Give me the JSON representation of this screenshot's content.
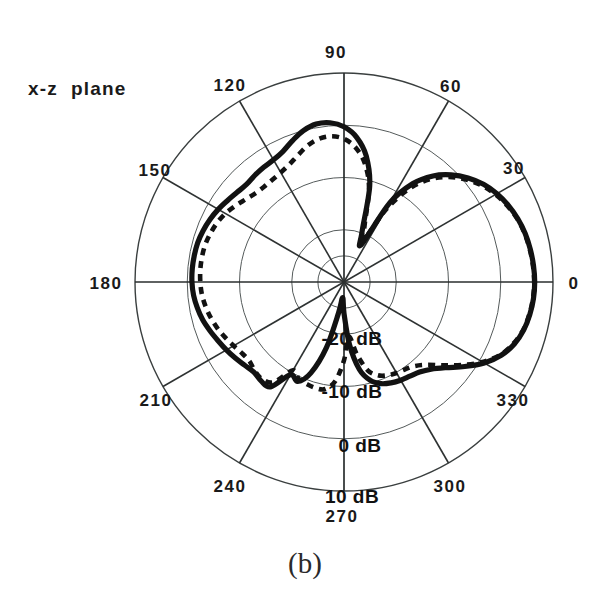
{
  "figure": {
    "plane_label": "x-z  plane",
    "caption": "(b)"
  },
  "chart_data": {
    "type": "line",
    "plot_style": "polar",
    "title": "x-z plane",
    "subtitle": "(b)",
    "xlabel": "",
    "ylabel": "",
    "grid": true,
    "legend_position": "none",
    "angular_axis": {
      "label": "angle (degrees)",
      "unit": "deg",
      "direction": "counterclockwise",
      "zero_at": "east",
      "tick_step": 30,
      "tick_labels": [
        "0",
        "30",
        "60",
        "90",
        "120",
        "150",
        "180",
        "210",
        "240",
        "270",
        "300",
        "330"
      ]
    },
    "radial_axis": {
      "label": "dB",
      "unit": "dB",
      "rlim": [
        -30,
        10
      ],
      "ring_values": [
        -20,
        -10,
        0,
        10
      ],
      "ring_labels": [
        "-20 dB",
        "-10 dB",
        "0 dB",
        "10 dB"
      ],
      "center_value": -30,
      "outer_value": 10
    },
    "series": [
      {
        "name": "measured",
        "style": "solid",
        "x": [
          0,
          5,
          10,
          15,
          20,
          25,
          30,
          35,
          40,
          45,
          50,
          55,
          60,
          65,
          70,
          75,
          80,
          85,
          90,
          95,
          100,
          105,
          110,
          115,
          120,
          125,
          130,
          135,
          140,
          145,
          150,
          155,
          160,
          165,
          170,
          175,
          180,
          185,
          190,
          195,
          200,
          205,
          210,
          215,
          220,
          225,
          230,
          235,
          240,
          245,
          250,
          255,
          260,
          265,
          270,
          275,
          280,
          285,
          290,
          295,
          300,
          305,
          310,
          315,
          320,
          325,
          330,
          335,
          340,
          345,
          350,
          355,
          360
        ],
        "values": [
          6.5,
          6.4,
          6.2,
          5.9,
          5.4,
          4.7,
          3.8,
          2.6,
          1.0,
          -1.0,
          -3.5,
          -7.0,
          -12.5,
          -22.0,
          -20.0,
          -11.0,
          -5.5,
          -2.2,
          -0.3,
          0.6,
          0.7,
          0.0,
          -1.2,
          -2.4,
          -3.0,
          -3.2,
          -3.4,
          -3.6,
          -3.3,
          -2.8,
          -2.2,
          -1.7,
          -1.3,
          -1.0,
          -0.9,
          -0.85,
          -0.9,
          -1.1,
          -1.5,
          -2.0,
          -2.7,
          -3.4,
          -4.0,
          -4.6,
          -5.2,
          -5.6,
          -5.3,
          -5.5,
          -9.5,
          -9.0,
          -11.5,
          -17.0,
          -24.0,
          -27.0,
          -24.0,
          -18.0,
          -13.0,
          -10.5,
          -9.3,
          -8.7,
          -8.3,
          -8.0,
          -7.5,
          -6.4,
          -4.5,
          -1.8,
          1.0,
          3.2,
          4.7,
          5.6,
          6.1,
          6.4,
          6.5
        ]
      },
      {
        "name": "computed",
        "style": "dashed",
        "x": [
          0,
          5,
          10,
          15,
          20,
          25,
          30,
          35,
          40,
          45,
          50,
          55,
          60,
          65,
          70,
          75,
          80,
          85,
          90,
          95,
          100,
          105,
          110,
          115,
          120,
          125,
          130,
          135,
          140,
          145,
          150,
          155,
          160,
          165,
          170,
          175,
          180,
          185,
          190,
          195,
          200,
          205,
          210,
          215,
          220,
          225,
          230,
          235,
          240,
          245,
          250,
          255,
          260,
          265,
          270,
          275,
          280,
          285,
          290,
          295,
          300,
          305,
          310,
          315,
          320,
          325,
          330,
          335,
          340,
          345,
          350,
          355,
          360
        ],
        "values": [
          6.4,
          6.3,
          6.1,
          5.8,
          5.3,
          4.5,
          3.5,
          2.2,
          0.5,
          -1.6,
          -4.3,
          -8.2,
          -14.0,
          -21.0,
          -18.5,
          -11.5,
          -7.0,
          -4.2,
          -2.6,
          -2.0,
          -2.2,
          -3.0,
          -4.2,
          -5.2,
          -5.8,
          -6.1,
          -6.2,
          -6.0,
          -5.4,
          -4.6,
          -3.8,
          -3.2,
          -2.8,
          -2.5,
          -2.4,
          -2.4,
          -2.5,
          -2.7,
          -3.1,
          -3.6,
          -4.2,
          -4.9,
          -5.6,
          -6.2,
          -6.4,
          -5.9,
          -5.7,
          -6.6,
          -10.5,
          -9.5,
          -9.2,
          -9.0,
          -9.2,
          -11.0,
          -15.0,
          -19.5,
          -16.0,
          -12.5,
          -11.0,
          -10.3,
          -9.9,
          -9.6,
          -9.0,
          -7.6,
          -5.2,
          -2.3,
          0.6,
          3.0,
          4.5,
          5.5,
          6.0,
          6.3,
          6.4
        ]
      }
    ],
    "annotations": [
      {
        "text": "x-z  plane",
        "position": "top-left"
      },
      {
        "text": "(b)",
        "position": "bottom-center"
      }
    ]
  },
  "angle_labels": [
    {
      "text": "0",
      "x": 574,
      "y": 289
    },
    {
      "text": "30",
      "x": 514,
      "y": 174
    },
    {
      "text": "60",
      "x": 451,
      "y": 92
    },
    {
      "text": "90",
      "x": 336,
      "y": 58
    },
    {
      "text": "120",
      "x": 230,
      "y": 91
    },
    {
      "text": "150",
      "x": 155,
      "y": 176
    },
    {
      "text": "180",
      "x": 106,
      "y": 289
    },
    {
      "text": "210",
      "x": 156,
      "y": 406
    },
    {
      "text": "240",
      "x": 230,
      "y": 492
    },
    {
      "text": "270",
      "x": 342,
      "y": 522
    },
    {
      "text": "300",
      "x": 450,
      "y": 492
    },
    {
      "text": "330",
      "x": 513,
      "y": 406
    }
  ],
  "radial_labels": [
    {
      "text": "-20 dB",
      "x": 352,
      "y": 345
    },
    {
      "text": "-10 dB",
      "x": 352,
      "y": 398
    },
    {
      "text": "0 dB",
      "x": 360,
      "y": 452
    },
    {
      "text": "10 dB",
      "x": 352,
      "y": 503
    }
  ]
}
